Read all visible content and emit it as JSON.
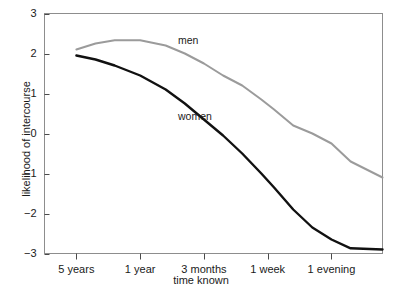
{
  "chart_data": {
    "type": "line",
    "title": "",
    "xlabel": "time known",
    "ylabel": "likelihood of intercourse",
    "ylim": [
      -3,
      3
    ],
    "yticks": [
      3,
      2,
      1,
      0,
      -1,
      -2,
      -3
    ],
    "ytick_labels": [
      "3",
      "2",
      "1",
      "0",
      "−1",
      "−2",
      "−3"
    ],
    "xtick_labels": [
      "5 years",
      "1 year",
      "3 months",
      "1 week",
      "1 evening"
    ],
    "xtick_positions": [
      0.5,
      1.5,
      2.5,
      3.5,
      4.5
    ],
    "xlim": [
      0,
      5.3
    ],
    "grid": false,
    "legend": "inline-annotations",
    "series": [
      {
        "name": "men",
        "color": "#9b9b9b",
        "annotation": "men",
        "x": [
          0.5,
          0.8,
          1.1,
          1.5,
          1.9,
          2.2,
          2.5,
          2.8,
          3.1,
          3.4,
          3.6,
          3.9,
          4.2,
          4.5,
          4.8,
          5.3
        ],
        "values": [
          2.1,
          2.25,
          2.33,
          2.33,
          2.2,
          2.0,
          1.75,
          1.45,
          1.2,
          0.85,
          0.6,
          0.2,
          0.0,
          -0.25,
          -0.7,
          -1.1
        ]
      },
      {
        "name": "women",
        "color": "#111111",
        "annotation": "women",
        "x": [
          0.5,
          0.8,
          1.1,
          1.5,
          1.9,
          2.2,
          2.5,
          2.8,
          3.1,
          3.4,
          3.6,
          3.9,
          4.2,
          4.5,
          4.8,
          5.3
        ],
        "values": [
          1.95,
          1.85,
          1.7,
          1.45,
          1.1,
          0.75,
          0.35,
          -0.05,
          -0.5,
          -1.0,
          -1.35,
          -1.9,
          -2.35,
          -2.65,
          -2.87,
          -2.9
        ]
      }
    ]
  },
  "annotations": {
    "men_label": "men",
    "women_label": "women"
  },
  "axes": {
    "y_title": "likelihood of intercourse",
    "x_title": "time known"
  }
}
